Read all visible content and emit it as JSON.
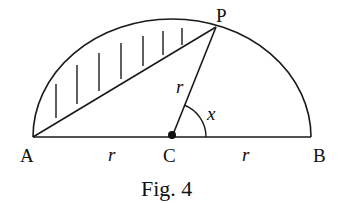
{
  "figure": {
    "caption": "Fig. 4",
    "points": {
      "A": {
        "label": "A",
        "x": 33,
        "y": 137
      },
      "C": {
        "label": "C",
        "x": 172,
        "y": 137
      },
      "B": {
        "label": "B",
        "x": 311,
        "y": 137
      },
      "P": {
        "label": "P",
        "x": 216,
        "y": 27
      }
    },
    "labels": {
      "radius_CP": "r",
      "radius_AC": "r",
      "radius_CB": "r",
      "angle": "x"
    },
    "colors": {
      "stroke": "#1a1a1a",
      "background": "#ffffff"
    }
  }
}
